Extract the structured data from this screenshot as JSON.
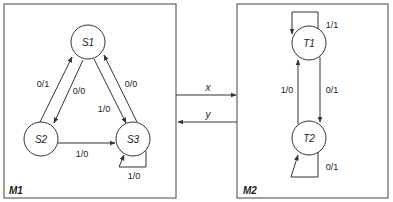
{
  "machines": {
    "m1": {
      "label": "M1",
      "states": {
        "s1": "S1",
        "s2": "S2",
        "s3": "S3"
      },
      "transitions": {
        "s2_to_s1": "0/1",
        "s1_to_s2": "0/0",
        "s1_to_s3": "1/0",
        "s3_to_s1": "0/0",
        "s2_to_s3": "1/0",
        "s3_self": "1/0"
      }
    },
    "m2": {
      "label": "M2",
      "states": {
        "t1": "T1",
        "t2": "T2"
      },
      "transitions": {
        "t1_self": "1/1",
        "t2_to_t1": "1/0",
        "t1_to_t2": "0/1",
        "t2_self": "0/1"
      }
    }
  },
  "signals": {
    "x": "x",
    "y": "y"
  },
  "colors": {
    "stroke": "#333333",
    "text": "#222222",
    "background": "#ffffff"
  }
}
